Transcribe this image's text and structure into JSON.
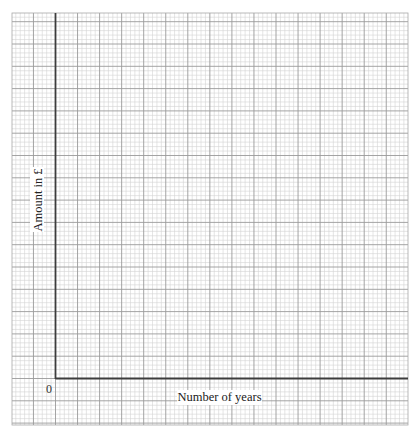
{
  "chart_data": {
    "type": "line",
    "title": "",
    "xlabel": "Number of years",
    "ylabel": "Amount in £",
    "origin_label": "0",
    "series": [],
    "x": [],
    "values": [],
    "grid": true,
    "grid_style": "graph paper: minor squares subdivided 5 per major square",
    "xlim": [
      0,
      null
    ],
    "ylim": [
      0,
      null
    ],
    "legend": null
  },
  "colors": {
    "background": "#ffffff",
    "minor_grid": "#d4d4d4",
    "major_grid": "#9a9a9a",
    "axis": "#3c3c3c",
    "label_text": "#222222"
  }
}
